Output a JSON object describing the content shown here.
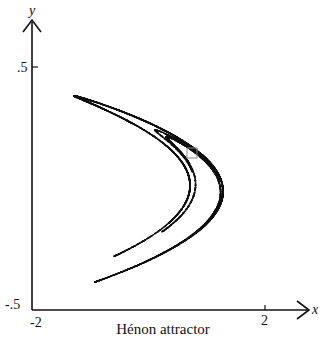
{
  "figure": {
    "caption": "Hénon attractor",
    "axes": {
      "x_label": "x",
      "y_label": "y",
      "x_ticks": [
        {
          "value": -2,
          "label": "-2"
        },
        {
          "value": 2,
          "label": "2"
        }
      ],
      "y_ticks": [
        {
          "value": 0.5,
          "label": ".5"
        },
        {
          "value": -0.5,
          "label": "-.5"
        }
      ],
      "xlim": [
        -2,
        2
      ],
      "ylim": [
        -0.5,
        0.5
      ]
    },
    "map": {
      "a": 1.4,
      "b": 0.3,
      "iterations": 12000
    },
    "highlight_box": {
      "x": 1.0,
      "y": 0.16,
      "size_units": "small square near upper branch"
    },
    "colors": {
      "ink": "#111111",
      "box": "#888888",
      "background": "#ffffff"
    }
  }
}
